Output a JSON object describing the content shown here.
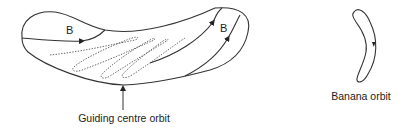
{
  "diagram": {
    "left_figure": {
      "field_label_left": "B",
      "field_label_right": "B",
      "caption": "Guiding centre orbit"
    },
    "right_figure": {
      "caption": "Banana orbit"
    },
    "colors": {
      "stroke": "#333333",
      "dotted": "#555555",
      "text": "#222222"
    }
  }
}
